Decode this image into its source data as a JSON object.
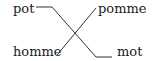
{
  "diagram": {
    "left_words": [
      "pot",
      "homme"
    ],
    "right_words": [
      "pomme",
      "mot"
    ],
    "connections": [
      {
        "from": "pot",
        "to": "mot"
      },
      {
        "from": "homme",
        "to": "pomme"
      }
    ],
    "line_color": "#333333",
    "text_color": "#1a1a1a"
  }
}
